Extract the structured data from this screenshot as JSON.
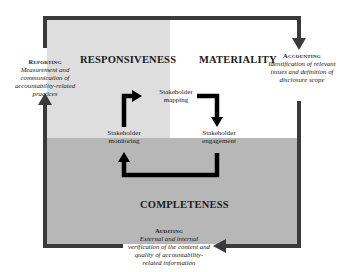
{
  "zones": {
    "responsiveness": {
      "label": "RESPONSIVENESS",
      "color": "#dedede"
    },
    "materiality": {
      "label": "MATERIALITY",
      "color": "#ffffff"
    },
    "completeness": {
      "label": "COMPLETENESS",
      "color": "#b7b7b7"
    }
  },
  "cycle": {
    "mapping": {
      "line1": "Stakeholder",
      "line2": "mapping"
    },
    "engagement": {
      "line1": "Stakeholder",
      "line2": "engagement"
    },
    "monitoring": {
      "line1": "Stakeholder",
      "line2": "monitoring"
    }
  },
  "stages": {
    "reporting": {
      "title": "Reporting",
      "desc": [
        "Measurement and",
        "communication of",
        "accountability-related",
        "practices"
      ]
    },
    "accounting": {
      "title": "Accounting",
      "desc": [
        "Identification of relevant",
        "issues and definition of",
        "disclosure scope"
      ]
    },
    "auditing": {
      "title": "Auditing",
      "desc": [
        "External and internal",
        "verification of the content and",
        "quality of accountability-",
        "related information"
      ]
    }
  },
  "colors": {
    "frame": "#3a3a3a",
    "arrow": "#000000"
  }
}
